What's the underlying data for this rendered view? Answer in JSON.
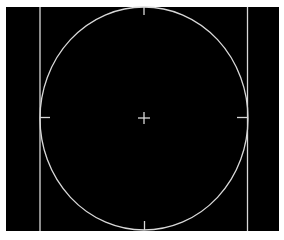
{
  "display": {
    "type": "viewfinder-overlay",
    "background": "#000000",
    "line_color": "#d8d8d8",
    "elements": [
      "ellipse-guide",
      "left-frame-line",
      "right-frame-line",
      "center-crosshair",
      "top-tick",
      "bottom-tick",
      "left-tick",
      "right-tick"
    ]
  }
}
